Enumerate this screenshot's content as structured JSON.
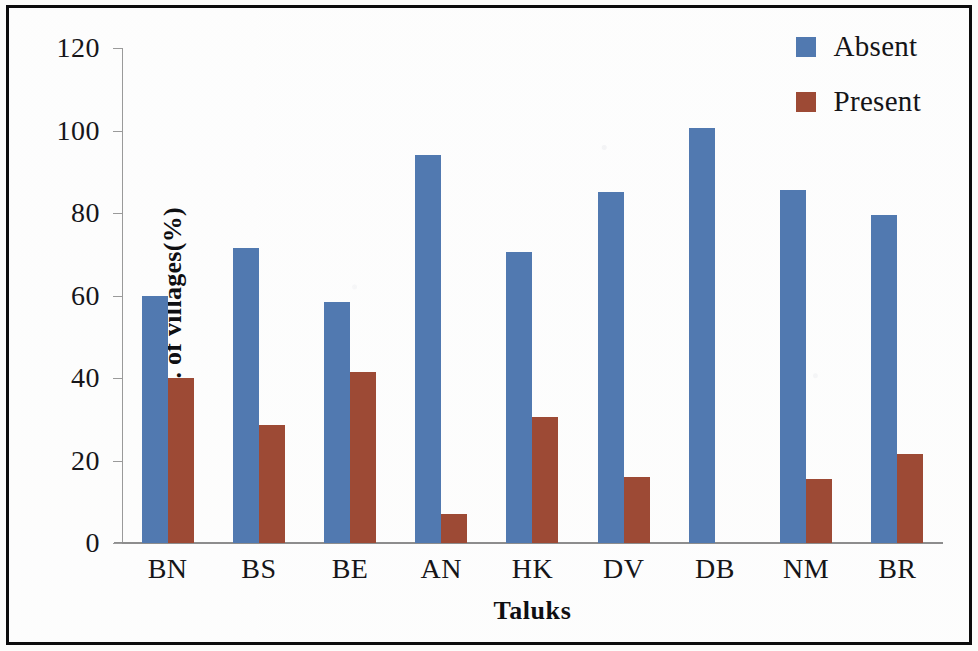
{
  "chart_data": {
    "type": "bar",
    "title": "",
    "subtitle": "",
    "xlabel": "Taluks",
    "ylabel": "No. of villages(%)",
    "categories": [
      "BN",
      "BS",
      "BE",
      "AN",
      "HK",
      "DV",
      "DB",
      "NM",
      "BR"
    ],
    "series": [
      {
        "name": "Absent",
        "color": "#5179b0",
        "values": [
          60,
          71.5,
          58.5,
          94,
          70.5,
          85,
          100.5,
          85.5,
          79.5
        ]
      },
      {
        "name": "Present",
        "color": "#9d4a35",
        "values": [
          40,
          28.5,
          41.5,
          7,
          30.5,
          16,
          0,
          15.5,
          21.5
        ]
      }
    ],
    "ylim": [
      0,
      120
    ],
    "yticks": [
      0,
      20,
      40,
      60,
      80,
      100,
      120
    ],
    "ytick_labels": [
      "0",
      "20",
      "40",
      "60",
      "80",
      "100",
      "120"
    ],
    "grid": false,
    "legend_position": "top-right",
    "bar_orientation": "vertical",
    "units": "%"
  },
  "figure": {
    "border_color": "#0d0d0d",
    "background": "#fefefd",
    "axis_color": "#9a9a9a"
  }
}
